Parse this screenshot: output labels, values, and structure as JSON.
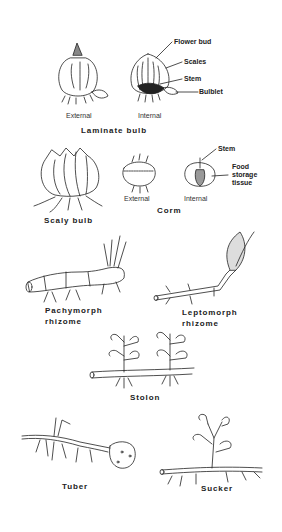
{
  "diagram": {
    "sections": {
      "laminate_bulb": {
        "title": "Laminate bulb",
        "views": [
          "External",
          "Internal"
        ],
        "callouts": [
          "Flower bud",
          "Scales",
          "Stem",
          "Bulblet"
        ]
      },
      "scaly_bulb": {
        "title": "Scaly bulb"
      },
      "corm": {
        "title": "Corm",
        "views": [
          "External",
          "Internal"
        ],
        "callouts": [
          "Stem",
          "Food",
          "storage",
          "tissue"
        ]
      },
      "pachymorph_rhizome": {
        "title_line1": "Pachymorph",
        "title_line2": "rhizome"
      },
      "leptomorph_rhizome": {
        "title_line1": "Leptomorph",
        "title_line2": "rhizome"
      },
      "stolon": {
        "title": "Stolon"
      },
      "tuber": {
        "title": "Tuber"
      },
      "sucker": {
        "title": "Sucker"
      }
    }
  }
}
